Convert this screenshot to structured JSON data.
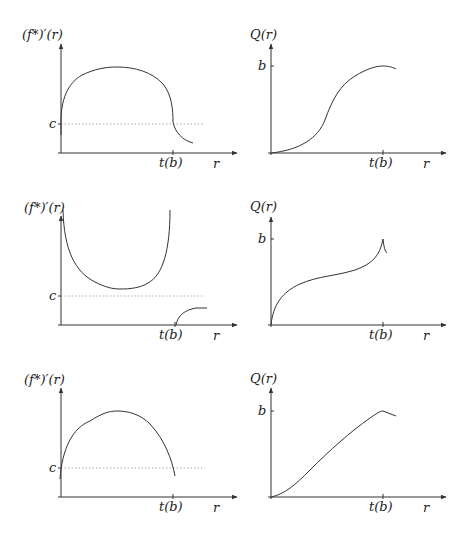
{
  "figure": {
    "panels": [
      {
        "id": "row1-left",
        "ylabel": "(f*)′(r)",
        "hline_label": "c",
        "tick_label": "t(b)",
        "xlabel": "r",
        "description": "Derivative rises from below c to an arc maximum, then falls steeply past c at t(b) and decays"
      },
      {
        "id": "row1-right",
        "ylabel": "Q(r)",
        "level_label": "b",
        "tick_label": "t(b)",
        "xlabel": "r",
        "description": "S-shaped increasing curve reaching b at t(b), then slightly decreasing"
      },
      {
        "id": "row2-left",
        "ylabel": "(f*)′(r)",
        "hline_label": "c",
        "tick_label": "t(b)",
        "xlabel": "r",
        "description": "U-shaped curve above c blowing up at both ends; second branch starts at t(b) from zero below c"
      },
      {
        "id": "row2-right",
        "ylabel": "Q(r)",
        "level_label": "b",
        "tick_label": "t(b)",
        "xlabel": "r",
        "description": "Concave-convex increasing curve reaching b with a cusp at t(b)"
      },
      {
        "id": "row3-left",
        "ylabel": "(f*)′(r)",
        "hline_label": "c",
        "tick_label": "t(b)",
        "xlabel": "r",
        "description": "Arc starting below c, maximum in middle, ending at c near t(b)"
      },
      {
        "id": "row3-right",
        "ylabel": "Q(r)",
        "level_label": "b",
        "tick_label": "t(b)",
        "xlabel": "r",
        "description": "Nearly linear increasing curve reaching b at t(b), then decreasing"
      }
    ]
  }
}
